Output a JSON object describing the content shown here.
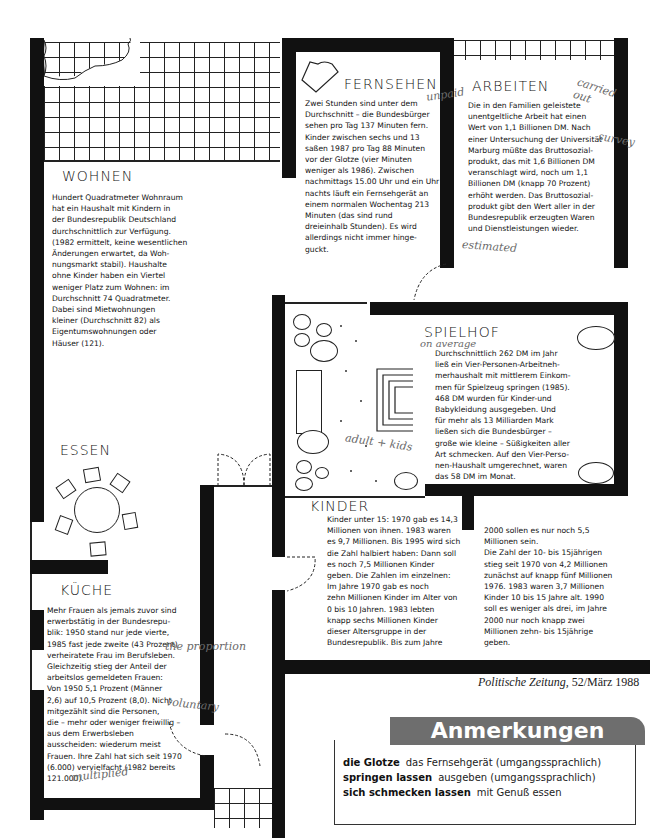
{
  "rooms": {
    "wohnen": {
      "title": "WOHNEN",
      "text": "Hundert Quadratmeter Wohnraum\nhat ein Haushalt mit Kindern in\nder Bundesrepublik Deutschland\ndurchschnittlich zur Verfügung.\n(1982 ermittelt, keine wesentlichen\nÄnderungen erwartet, da Woh-\nnungsmarkt stabil). Haushalte\nohne Kinder haben ein Viertel\nweniger Platz zum Wohnen: im\nDurchschnitt 74 Quadratmeter.\nDabei sind Mietwohnungen\nkleiner (Durchschnitt 82) als\nEigentumswohnungen oder\nHäuser (121)."
    },
    "fernsehen": {
      "title": "FERNSEHEN",
      "text": "Zwei Stunden sind unter dem\nDurchschnitt – die Bundesbürger\nsehen pro Tag 137 Minuten fern.\nKinder zwischen sechs und 13\nsaßen 1987 pro Tag 88 Minuten\nvor der Glotze (vier Minuten\nweniger als 1986). Zwischen\nnachmittags 15.00 Uhr und ein Uhr\nnachts läuft ein Fernsehgerät an\neinem normalen Wochentag 213\nMinuten (das sind rund\ndreieinhalb Stunden). Es wird\nallerdings nicht immer hinge-\nguckt."
    },
    "arbeiten": {
      "title": "ARBEITEN",
      "text": "Die in den Familien geleistete\nunentgeltliche Arbeit hat einen\nWert von 1,1 Billionen DM. Nach\neiner Untersuchung der Universität\nMarburg müßte das Bruttosozial-\nprodukt, das mit 1,6 Billionen DM\nveranschlagt wird, noch um 1,1\nBillionen DM (knapp 70 Prozent)\nerhöht werden. Das Bruttosozial-\nprodukt gibt den Wert aller in der\nBundesrepublik erzeugten Waren\nund Dienstleistungen wieder."
    },
    "spielhof": {
      "title": "SPIELHOF",
      "text": "Durchschnittlich 262 DM im Jahr\nließ ein Vier-Personen-Arbeitneh-\nmerhaushalt mit mittlerem Einkom-\nmen für Spielzeug springen (1985).\n468 DM wurden für Kinder-und\nBabykleidung ausgegeben. Und\nfür mehr als 13 Milliarden Mark\nließen sich die Bundesbürger –\ngroße wie kleine – Süßigkeiten aller\nArt schmecken. Auf den Vier-Perso-\nnen-Haushalt umgerechnet, waren\ndas 58 DM im Monat."
    },
    "essen": {
      "title": "ESSEN"
    },
    "kinder": {
      "title": "KINDER",
      "text_col1": "Kinder unter 15: 1970 gab es 14,3\nMillionen von ihnen. 1983 waren\nes 9,7 Millionen. Bis 1995 wird sich\ndie Zahl halbiert haben: Dann soll\nes noch 7,5 Millionen Kinder\ngeben. Die Zahlen im einzelnen:\n    Im Jahre 1970 gab es noch\nzehn Millionen Kinder im Alter von\n0 bis 10 Jahren. 1983 lebten\nknapp sechs Millionen Kinder\ndieser Altersgruppe in der\nBundesrepublik. Bis zum Jahre",
      "text_col2": "2000 sollen es nur noch 5,5\nMillionen sein.\n    Die Zahl der 10- bis 15jährigen\nstieg seit 1970 von 4,2 Millionen\nzunächst auf knapp fünf Millionen\n1976. 1983 waren 3,7 Millionen\nKinder 10 bis 15 Jahre alt. 1990\nsoll es weniger als drei, im Jahre\n2000 nur noch knapp zwei\nMillionen zehn- bis 15jährige\ngeben."
    },
    "kueche": {
      "title": "KÜCHE",
      "text": "Mehr Frauen als jemals zuvor sind\nerwerbstätig in der Bundesrepu-\nblik: 1950 stand nur jede vierte,\n1985 fast jede zweite (43 Prozent)\nverheiratete Frau im Berufsleben.\nGleichzeitig stieg der Anteil der\narbeitslos gemeldeten Frauen:\nVon 1950 5,1 Prozent (Männer\n2,6) auf 10,5 Prozent (8,0). Nicht\nmitgezählt sind die Personen,\ndie – mehr oder weniger freiwillig –\naus dem Erwerbsleben\nausscheiden: wiederum meist\nFrauen. Ihre Zahl hat sich seit 1970\n(6.000) vervielfacht (1982 bereits\n121.000)."
    }
  },
  "handwritten_notes": {
    "unpaid": "unpaid",
    "carried_out": "carried out",
    "survey": "survey",
    "estimated": "estimated",
    "on_average": "on average",
    "adults_kids": "adult + kids",
    "the_proportion": "the proportion",
    "voluntary": "voluntary",
    "multiplied": "multiplied"
  },
  "source": {
    "publication": "Politische Zeitung,",
    "issue": "52/März 1988"
  },
  "anmerkungen": {
    "title": "Anmerkungen",
    "entries": [
      {
        "term": "die Glotze",
        "definition": "das Fernsehgerät (umgangssprachlich)"
      },
      {
        "term": "springen lassen",
        "definition": "ausgeben (umgangssprachlich)"
      },
      {
        "term": "sich schmecken lassen",
        "definition": "mit Genuß essen"
      }
    ],
    "header_color": "#6e6e6e"
  }
}
